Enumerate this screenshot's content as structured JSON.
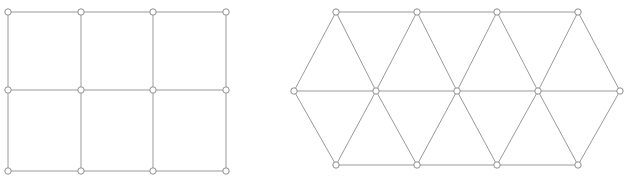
{
  "figure": {
    "background_color": "#ffffff",
    "edge_color": "#9a9a9a",
    "node_fill_color": "#ffffff",
    "node_stroke_color": "#8f8f8f",
    "node_radius": 3.2,
    "edge_width": 1,
    "width": 627,
    "height": 183,
    "panels": [
      {
        "id": "square-lattice",
        "name": "square-lattice-panel",
        "lattice_type": "square",
        "rows": 3,
        "columns": 4,
        "node_count": 12,
        "edge_count": 17,
        "nodes": [
          {
            "id": "s00",
            "x": 8,
            "y": 12
          },
          {
            "id": "s01",
            "x": 81,
            "y": 12
          },
          {
            "id": "s02",
            "x": 153,
            "y": 12
          },
          {
            "id": "s03",
            "x": 226,
            "y": 12
          },
          {
            "id": "s10",
            "x": 8,
            "y": 90
          },
          {
            "id": "s11",
            "x": 81,
            "y": 90
          },
          {
            "id": "s12",
            "x": 153,
            "y": 90
          },
          {
            "id": "s13",
            "x": 226,
            "y": 90
          },
          {
            "id": "s20",
            "x": 8,
            "y": 171
          },
          {
            "id": "s21",
            "x": 81,
            "y": 171
          },
          {
            "id": "s22",
            "x": 153,
            "y": 171
          },
          {
            "id": "s23",
            "x": 226,
            "y": 171
          }
        ],
        "edges": [
          [
            "s00",
            "s01"
          ],
          [
            "s01",
            "s02"
          ],
          [
            "s02",
            "s03"
          ],
          [
            "s10",
            "s11"
          ],
          [
            "s11",
            "s12"
          ],
          [
            "s12",
            "s13"
          ],
          [
            "s20",
            "s21"
          ],
          [
            "s21",
            "s22"
          ],
          [
            "s22",
            "s23"
          ],
          [
            "s00",
            "s10"
          ],
          [
            "s10",
            "s20"
          ],
          [
            "s01",
            "s11"
          ],
          [
            "s11",
            "s21"
          ],
          [
            "s02",
            "s12"
          ],
          [
            "s12",
            "s22"
          ],
          [
            "s03",
            "s13"
          ],
          [
            "s13",
            "s23"
          ]
        ]
      },
      {
        "id": "triangular-lattice",
        "name": "triangular-lattice-panel",
        "lattice_type": "triangular",
        "rows": 3,
        "node_count": 13,
        "edge_count": 28,
        "nodes": [
          {
            "id": "t00",
            "x": 336,
            "y": 12
          },
          {
            "id": "t01",
            "x": 417,
            "y": 12
          },
          {
            "id": "t02",
            "x": 497,
            "y": 12
          },
          {
            "id": "t03",
            "x": 578,
            "y": 12
          },
          {
            "id": "t10",
            "x": 294,
            "y": 91
          },
          {
            "id": "t11",
            "x": 376,
            "y": 91
          },
          {
            "id": "t12",
            "x": 457,
            "y": 91
          },
          {
            "id": "t13",
            "x": 538,
            "y": 91
          },
          {
            "id": "t14",
            "x": 620,
            "y": 91
          },
          {
            "id": "t20",
            "x": 336,
            "y": 165
          },
          {
            "id": "t21",
            "x": 417,
            "y": 165
          },
          {
            "id": "t22",
            "x": 497,
            "y": 165
          },
          {
            "id": "t23",
            "x": 578,
            "y": 165
          }
        ],
        "edges": [
          [
            "t00",
            "t01"
          ],
          [
            "t01",
            "t02"
          ],
          [
            "t02",
            "t03"
          ],
          [
            "t10",
            "t11"
          ],
          [
            "t11",
            "t12"
          ],
          [
            "t12",
            "t13"
          ],
          [
            "t13",
            "t14"
          ],
          [
            "t20",
            "t21"
          ],
          [
            "t21",
            "t22"
          ],
          [
            "t22",
            "t23"
          ],
          [
            "t10",
            "t00"
          ],
          [
            "t00",
            "t11"
          ],
          [
            "t11",
            "t01"
          ],
          [
            "t01",
            "t12"
          ],
          [
            "t12",
            "t02"
          ],
          [
            "t02",
            "t13"
          ],
          [
            "t13",
            "t03"
          ],
          [
            "t03",
            "t14"
          ],
          [
            "t10",
            "t20"
          ],
          [
            "t20",
            "t11"
          ],
          [
            "t11",
            "t21"
          ],
          [
            "t21",
            "t12"
          ],
          [
            "t12",
            "t22"
          ],
          [
            "t22",
            "t13"
          ],
          [
            "t13",
            "t23"
          ],
          [
            "t23",
            "t14"
          ]
        ]
      }
    ]
  }
}
